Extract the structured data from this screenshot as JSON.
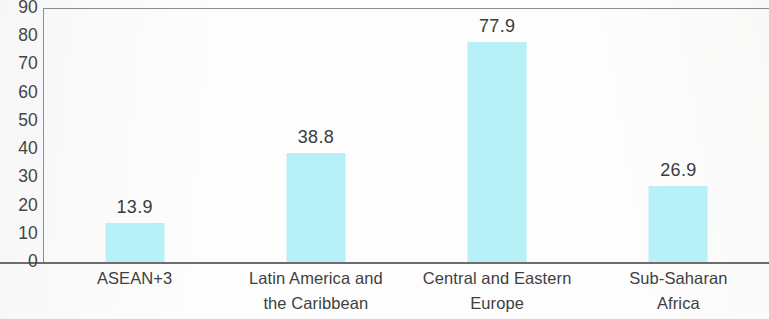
{
  "chart_data": {
    "type": "bar",
    "title": "",
    "subtitle": "",
    "xlabel": "",
    "ylabel": "",
    "categories": [
      "ASEAN+3",
      "Latin America and the Caribbean",
      "Central and Eastern Europe",
      "Sub-Saharan Africa"
    ],
    "category_lines": [
      [
        "ASEAN+3"
      ],
      [
        "Latin America and",
        "the Caribbean"
      ],
      [
        "Central and Eastern",
        "Europe"
      ],
      [
        "Sub-Saharan",
        "Africa"
      ]
    ],
    "values": [
      13.9,
      38.8,
      77.9,
      26.9
    ],
    "value_labels": [
      "13.9",
      "38.8",
      "77.9",
      "26.9"
    ],
    "ylim": [
      0,
      90
    ],
    "ytick_values": [
      90,
      80,
      70,
      60,
      50,
      40,
      30,
      20,
      10,
      0
    ],
    "ytick_labels": [
      "90",
      "80",
      "70",
      "60",
      "50",
      "40",
      "30",
      "20",
      "10",
      "0"
    ],
    "ytick_step": 10,
    "grid": false,
    "legend": null,
    "legend_position": "none",
    "bar_color": "#b7f0f7",
    "axis_color": "#8d8d8d",
    "text_color": "#3a3a3a",
    "background_color": "#ffffff"
  }
}
